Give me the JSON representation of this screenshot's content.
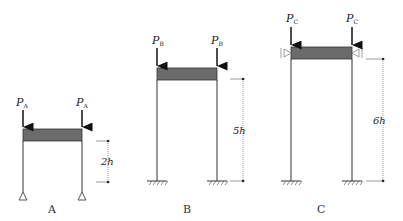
{
  "frames": [
    {
      "id": "A",
      "caption": "A",
      "load_label": "P",
      "load_sub": "A",
      "height_label": "2h",
      "support": "pinned"
    },
    {
      "id": "B",
      "caption": "B",
      "load_label": "P",
      "load_sub": "B",
      "height_label": "5h",
      "support": "fixed"
    },
    {
      "id": "C",
      "caption": "C",
      "load_label": "P",
      "load_sub": "C",
      "height_label": "6h",
      "support": "fixed, lateral guide at beam"
    }
  ],
  "colors": {
    "beam_fill": "#6b6b6b",
    "line": "#333333"
  }
}
